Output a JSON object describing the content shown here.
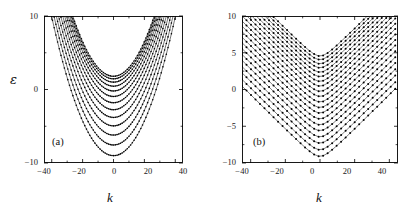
{
  "figure": {
    "background": "#ffffff",
    "ink": "#000000",
    "width": 417,
    "height": 222
  },
  "panels": [
    {
      "tag": "(a)",
      "tag_name": "panel-a",
      "axis_label_y": "ε",
      "axis_label_x": "k",
      "y_tick_labels": [
        "10",
        "0",
        "−10"
      ],
      "x_tick_labels": [
        "−40",
        "−20",
        "0",
        "20",
        "40"
      ]
    },
    {
      "tag": "(b)",
      "tag_name": "panel-b",
      "axis_label_y": "",
      "axis_label_x": "k",
      "y_tick_labels": [
        "10",
        "5",
        "0",
        "−5",
        "−10"
      ],
      "x_tick_labels": [
        "−40",
        "−20",
        "0",
        "20",
        "40"
      ]
    }
  ],
  "chart_data": [
    {
      "type": "line",
      "title": "",
      "panel": "(a)",
      "xlabel": "k",
      "ylabel": "ε",
      "xlim": [
        -45,
        45
      ],
      "ylim": [
        -10,
        10
      ],
      "grid": false,
      "legend": "none",
      "x_ticks_major": [
        -40,
        -20,
        0,
        20,
        40
      ],
      "x_ticks_minor": [
        -30,
        -10,
        10,
        30
      ],
      "y_ticks_major": [
        -10,
        0,
        10
      ],
      "y_ticks_minor": [
        -5,
        5
      ],
      "y_tick_labels_shown": [
        "10",
        "0",
        "−10"
      ],
      "marker": "filled-circle",
      "marker_size_px": 1.6,
      "description": "Family of nested parabolic dispersion branches, all centred at k = 0, clipped at the top of the frame at ε = 10. Each branch follows ε = e0 + c*k^2 with the same curvature c and vertex energies e0 stepping upward.",
      "curve_family": {
        "form": "eps = vertex + curvature * k^2",
        "curvature": 0.0118,
        "vertices": [
          -9.0,
          -7.55,
          -6.2,
          -4.95,
          -3.8,
          -2.75,
          -1.8,
          -0.95,
          -0.2,
          0.45,
          1.0,
          1.45,
          1.8
        ],
        "n_branches": 13,
        "sample_step_k": 1.1
      },
      "series": [
        {
          "name": "branch-1",
          "vertex": -9.0
        },
        {
          "name": "branch-2",
          "vertex": -7.55
        },
        {
          "name": "branch-3",
          "vertex": -6.2
        },
        {
          "name": "branch-4",
          "vertex": -4.95
        },
        {
          "name": "branch-5",
          "vertex": -3.8
        },
        {
          "name": "branch-6",
          "vertex": -2.75
        },
        {
          "name": "branch-7",
          "vertex": -1.8
        },
        {
          "name": "branch-8",
          "vertex": -0.95
        },
        {
          "name": "branch-9",
          "vertex": -0.2
        },
        {
          "name": "branch-10",
          "vertex": 0.45
        },
        {
          "name": "branch-11",
          "vertex": 1.0
        },
        {
          "name": "branch-12",
          "vertex": 1.45
        },
        {
          "name": "branch-13",
          "vertex": 1.8
        }
      ]
    },
    {
      "type": "line",
      "title": "",
      "panel": "(b)",
      "xlabel": "k",
      "ylabel": "",
      "xlim": [
        -45,
        45
      ],
      "ylim": [
        -10,
        10
      ],
      "grid": false,
      "legend": "none",
      "x_ticks_major": [
        -40,
        -20,
        0,
        20,
        40
      ],
      "x_ticks_minor": [
        -30,
        -10,
        10,
        30
      ],
      "y_ticks_major": [
        -10,
        -5,
        0,
        5,
        10
      ],
      "y_ticks_minor": [
        -7.5,
        -2.5,
        2.5,
        7.5
      ],
      "y_tick_labels_shown": [
        "10",
        "5",
        "0",
        "−5",
        "−10"
      ],
      "marker": "filled-circle",
      "marker_size_px": 2.0,
      "description": "Family of chevron / V-shaped dispersion branches with sharp vertices at k = 0 that become straight diagonal segments at large |k|. Branches are built from discretely spaced data points joined by thin lines, clipped at ε = 10.",
      "curve_family": {
        "form": "eps = vertex + slope * sqrt(k^2 + softening^2)",
        "slope": 0.235,
        "softening": 4.5,
        "vertices": [
          -9.1,
          -8.2,
          -7.3,
          -6.45,
          -5.6,
          -4.8,
          -4.0,
          -3.2,
          -2.45,
          -1.7,
          -0.95,
          -0.25,
          0.45,
          1.1,
          1.75,
          2.35,
          2.95,
          3.5,
          4.05,
          4.55
        ],
        "n_branches": 20,
        "sample_step_k": 2.6
      },
      "series": [
        {
          "name": "branch-1",
          "vertex": -9.1
        },
        {
          "name": "branch-2",
          "vertex": -8.2
        },
        {
          "name": "branch-3",
          "vertex": -7.3
        },
        {
          "name": "branch-4",
          "vertex": -6.45
        },
        {
          "name": "branch-5",
          "vertex": -5.6
        },
        {
          "name": "branch-6",
          "vertex": -4.8
        },
        {
          "name": "branch-7",
          "vertex": -4.0
        },
        {
          "name": "branch-8",
          "vertex": -3.2
        },
        {
          "name": "branch-9",
          "vertex": -2.45
        },
        {
          "name": "branch-10",
          "vertex": -1.7
        },
        {
          "name": "branch-11",
          "vertex": -0.95
        },
        {
          "name": "branch-12",
          "vertex": -0.25
        },
        {
          "name": "branch-13",
          "vertex": 0.45
        },
        {
          "name": "branch-14",
          "vertex": 1.1
        },
        {
          "name": "branch-15",
          "vertex": 1.75
        },
        {
          "name": "branch-16",
          "vertex": 2.35
        },
        {
          "name": "branch-17",
          "vertex": 2.95
        },
        {
          "name": "branch-18",
          "vertex": 3.5
        },
        {
          "name": "branch-19",
          "vertex": 4.05
        },
        {
          "name": "branch-20",
          "vertex": 4.55
        }
      ]
    }
  ]
}
